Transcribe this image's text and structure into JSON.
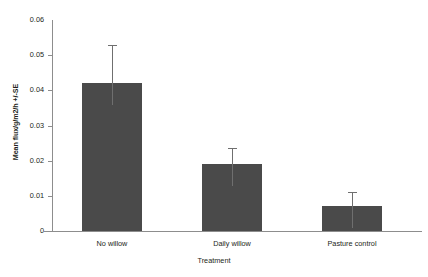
{
  "chart_data": {
    "type": "bar",
    "title": "",
    "xlabel": "Treatment",
    "ylabel": "Mean flux/g/m2/h +/-SE",
    "categories": [
      "No willow",
      "Daily willow",
      "Pasture control"
    ],
    "values": [
      0.042,
      0.019,
      0.007
    ],
    "errors": [
      0.011,
      0.0046,
      0.004
    ],
    "ylim": [
      0,
      0.06
    ],
    "yticks": [
      0.06,
      0.05,
      0.04,
      0.03,
      0.02,
      0.01,
      0
    ],
    "ytick_labels": [
      "0.06",
      "0.05",
      "0.04",
      "0.03",
      "0.02",
      "0.01",
      "0"
    ],
    "grid": false,
    "legend": "none",
    "series": [
      {
        "name": "Mean flux",
        "values": [
          0.042,
          0.019,
          0.007
        ],
        "errors": [
          0.011,
          0.0046,
          0.004
        ]
      }
    ],
    "colors": {
      "bar": "#4a4a4a",
      "errorbar": "#6f6f6f",
      "axis": "#8d8d8d",
      "text": "#231f20",
      "background": "#ffffff"
    }
  }
}
